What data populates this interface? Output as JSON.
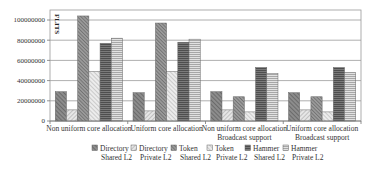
{
  "chart_data": {
    "type": "bar",
    "title": "",
    "xlabel": "",
    "ylabel": "FLITS",
    "ylim": [
      0,
      110000000
    ],
    "yticks": [
      0,
      20000000,
      40000000,
      60000000,
      80000000,
      100000000
    ],
    "ytick_labels": [
      "0",
      "20000000",
      "40000000",
      "60000000",
      "80000000",
      "100000000"
    ],
    "grid": true,
    "legend_position": "bottom",
    "categories": [
      [
        "Non uniform core allocation"
      ],
      [
        "Uniform core allocation"
      ],
      [
        "Non uniform core allocation",
        "Broadcast support"
      ],
      [
        "Uniform core allocation",
        "Broadcast support"
      ]
    ],
    "series": [
      {
        "name": "Directory Shared L2",
        "legend_lines": [
          "Directory",
          "Shared L2"
        ],
        "values": [
          29000000,
          28000000,
          29000000,
          28000000
        ],
        "fill": "#8c8c8c",
        "hatch": "diag-back",
        "hatch_color": "#555555"
      },
      {
        "name": "Directory Private L2",
        "legend_lines": [
          "Directory",
          "Private L2"
        ],
        "values": [
          11000000,
          10000000,
          11000000,
          11000000
        ],
        "fill": "#e6e6e6",
        "hatch": "diag-fwd",
        "hatch_color": "#9a9a9a"
      },
      {
        "name": "Token Shared L2",
        "legend_lines": [
          "Token",
          "Shared L2"
        ],
        "values": [
          104000000,
          97000000,
          24000000,
          24000000
        ],
        "fill": "#9a9a9a",
        "hatch": "diag-back-dense",
        "hatch_color": "#555555"
      },
      {
        "name": "Token Private L2",
        "legend_lines": [
          "Token",
          "Private L2"
        ],
        "values": [
          49000000,
          49000000,
          9000000,
          9000000
        ],
        "fill": "#ececec",
        "hatch": "diag-back-light",
        "hatch_color": "#a8a8a8"
      },
      {
        "name": "Hammer Shared L2",
        "legend_lines": [
          "Hammer",
          "Shared L2"
        ],
        "values": [
          77000000,
          78000000,
          53000000,
          53000000
        ],
        "fill": "#7a7a7a",
        "hatch": "horiz-dense",
        "hatch_color": "#4a4a4a"
      },
      {
        "name": "Hammer Private L2",
        "legend_lines": [
          "Hammer",
          "Private L2"
        ],
        "values": [
          82000000,
          81000000,
          47000000,
          48000000
        ],
        "fill": "#e2e2e2",
        "hatch": "horiz",
        "hatch_color": "#a0a0a0"
      }
    ]
  }
}
